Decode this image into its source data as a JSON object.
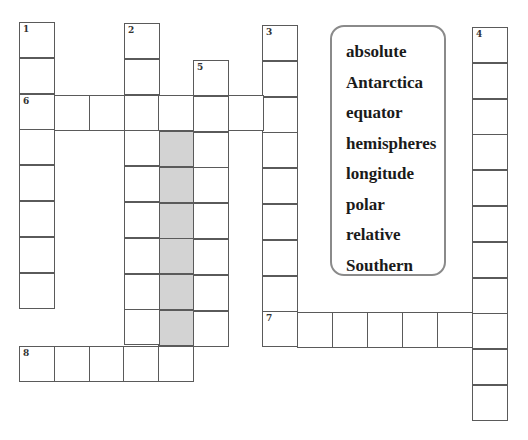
{
  "puzzle": {
    "type": "crossword",
    "cell_size": 36,
    "colors": {
      "border": "#5a5a5a",
      "shaded": "#d3d3d3",
      "word_bank_border": "#8a8a8a"
    }
  },
  "entries": [
    {
      "number": "1",
      "direction": "down",
      "x": 19,
      "y": 22,
      "length": 8
    },
    {
      "number": "2",
      "direction": "down",
      "x": 124,
      "y": 23,
      "length": 9
    },
    {
      "number": "3",
      "direction": "down",
      "x": 262,
      "y": 25,
      "length": 9
    },
    {
      "number": "4",
      "direction": "down",
      "x": 472,
      "y": 27,
      "length": 11
    },
    {
      "number": "5",
      "direction": "down",
      "x": 193,
      "y": 60,
      "length": 8
    },
    {
      "number": "6",
      "direction": "across",
      "x": 19,
      "y": 95,
      "length": 8
    },
    {
      "number": "7",
      "direction": "across",
      "x": 262,
      "y": 312,
      "length": 7
    },
    {
      "number": "8",
      "direction": "across",
      "x": 19,
      "y": 346,
      "length": 5
    }
  ],
  "shaded_block": {
    "x": 158,
    "y": 131,
    "length": 6
  },
  "word_bank": {
    "words": [
      "absolute",
      "Antarctica",
      "equator",
      "hemispheres",
      "longitude",
      "polar",
      "relative",
      "Southern"
    ]
  }
}
